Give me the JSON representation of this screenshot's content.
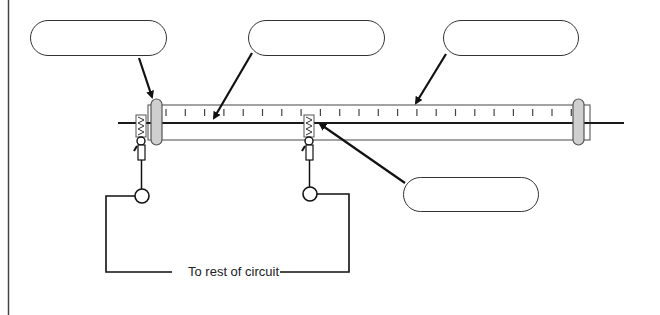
{
  "diagram": {
    "title": "",
    "callouts": [
      {
        "id": "label-1",
        "text": ""
      },
      {
        "id": "label-2",
        "text": ""
      },
      {
        "id": "label-3",
        "text": ""
      },
      {
        "id": "label-4",
        "text": ""
      }
    ],
    "circuit_caption": "To rest of circuit",
    "ruler_tick_count": 22,
    "colors": {
      "line": "#1a1a1a",
      "tube_outline": "#555555",
      "end_cap_fill": "#cfcfcf",
      "callout_border": "#333333",
      "background": "#ffffff"
    }
  }
}
